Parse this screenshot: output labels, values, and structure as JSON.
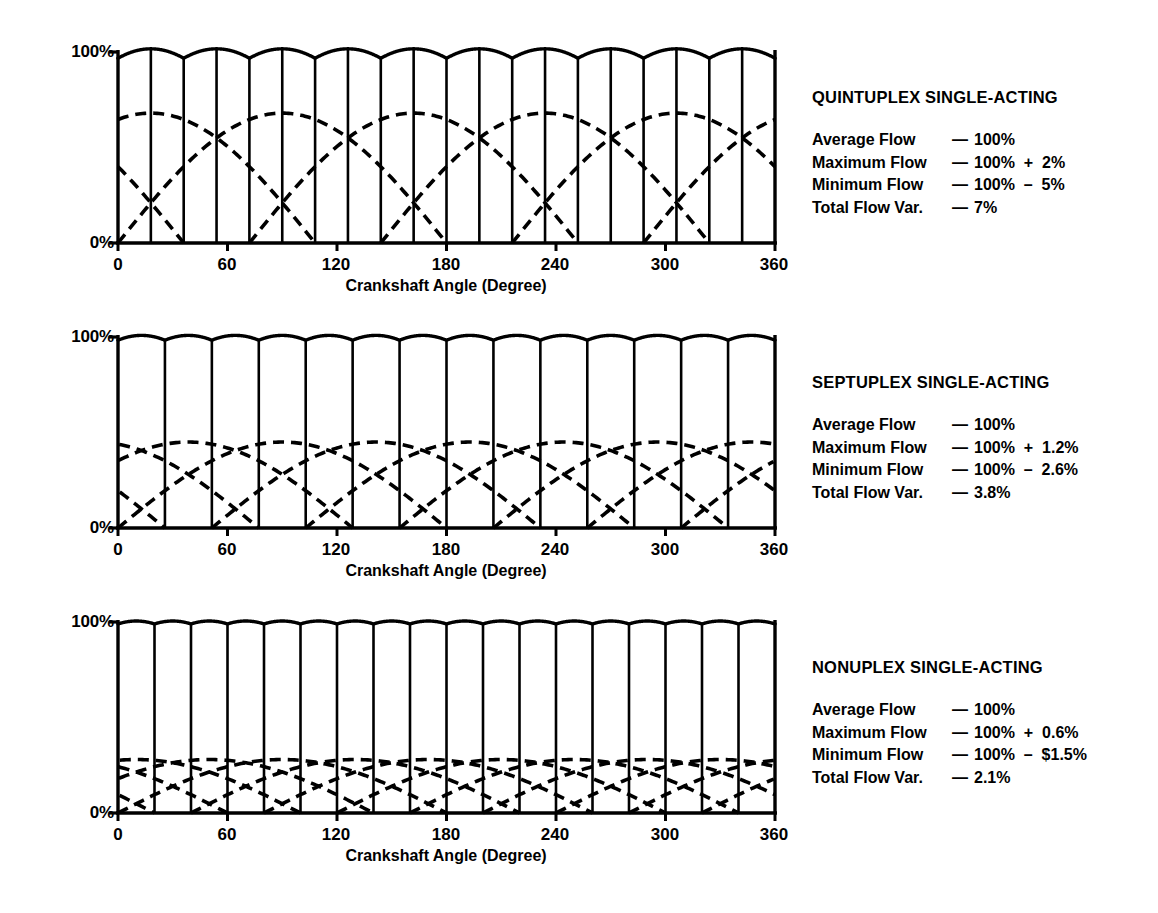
{
  "axis": {
    "y_top_label": "100%",
    "y_bottom_label": "0%",
    "x_title": "Crankshaft Angle (Degree)",
    "x_ticks": [
      "0",
      "60",
      "120",
      "180",
      "240",
      "300",
      "360"
    ]
  },
  "legend_labels": {
    "average": "Average Flow",
    "maximum": "Maximum Flow",
    "minimum": "Minimum Flow",
    "total": "Total Flow Var.",
    "dash": "—"
  },
  "panels": [
    {
      "title": "QUINTUPLEX SINGLE-ACTING",
      "average_flow": "100%",
      "maximum_flow": "100%  +  2%",
      "minimum_flow": "100%  –  5%",
      "total_flow_var": "7%"
    },
    {
      "title": "SEPTUPLEX SINGLE-ACTING",
      "average_flow": "100%",
      "maximum_flow": "100%  +  1.2%",
      "minimum_flow": "100%  –  2.6%",
      "total_flow_var": "3.8%"
    },
    {
      "title": "NONUPLEX SINGLE-ACTING",
      "average_flow": "100%",
      "maximum_flow": "100%  +  0.6%",
      "minimum_flow": "100%  –  $1.5%",
      "total_flow_var": "2.1%"
    }
  ],
  "chart_data": [
    {
      "type": "line",
      "title": "QUINTUPLEX SINGLE-ACTING",
      "xlabel": "Crankshaft Angle (Degree)",
      "ylabel": "",
      "xlim": [
        0,
        360
      ],
      "ylim": [
        0,
        108
      ],
      "xticks": [
        0,
        60,
        120,
        180,
        240,
        300,
        360
      ],
      "yticks": [
        0,
        100
      ],
      "ytick_labels": [
        "0%",
        "100%"
      ],
      "grid": false,
      "plungers": 5,
      "pulses_per_rev": 10,
      "divisions": 20,
      "plunger_peak_pct": 68,
      "combined_mean_pct": 100,
      "combined_max_pct": 102,
      "combined_min_pct": 95,
      "total_variation_pct": 7,
      "series": [
        {
          "name": "individual plunger flow",
          "style": "dashed",
          "shape": "half-sine",
          "count": 5,
          "phase_step_deg": 72,
          "amplitude_pct": 68
        },
        {
          "name": "combined flow",
          "style": "solid",
          "shape": "scalloped",
          "ripple_peaks": 10,
          "mean_pct": 100
        }
      ]
    },
    {
      "type": "line",
      "title": "SEPTUPLEX SINGLE-ACTING",
      "xlabel": "Crankshaft Angle (Degree)",
      "ylabel": "",
      "xlim": [
        0,
        360
      ],
      "ylim": [
        0,
        108
      ],
      "xticks": [
        0,
        60,
        120,
        180,
        240,
        300,
        360
      ],
      "yticks": [
        0,
        100
      ],
      "ytick_labels": [
        "0%",
        "100%"
      ],
      "grid": false,
      "plungers": 7,
      "pulses_per_rev": 14,
      "divisions": 14,
      "plunger_peak_pct": 45,
      "combined_mean_pct": 100,
      "combined_max_pct": 101.2,
      "combined_min_pct": 97.4,
      "total_variation_pct": 3.8,
      "series": [
        {
          "name": "individual plunger flow",
          "style": "dashed",
          "shape": "half-sine",
          "count": 7,
          "phase_step_deg": 51.43,
          "amplitude_pct": 45
        },
        {
          "name": "combined flow",
          "style": "solid",
          "shape": "scalloped",
          "ripple_peaks": 14,
          "mean_pct": 100
        }
      ]
    },
    {
      "type": "line",
      "title": "NONUPLEX SINGLE-ACTING",
      "xlabel": "Crankshaft Angle (Degree)",
      "ylabel": "",
      "xlim": [
        0,
        360
      ],
      "ylim": [
        0,
        108
      ],
      "xticks": [
        0,
        60,
        120,
        180,
        240,
        300,
        360
      ],
      "yticks": [
        0,
        100
      ],
      "ytick_labels": [
        "0%",
        "100%"
      ],
      "grid": false,
      "plungers": 9,
      "pulses_per_rev": 18,
      "divisions": 18,
      "plunger_peak_pct": 28,
      "combined_mean_pct": 100,
      "combined_max_pct": 100.6,
      "combined_min_pct": 98.5,
      "total_variation_pct": 2.1,
      "series": [
        {
          "name": "individual plunger flow",
          "style": "dashed",
          "shape": "half-sine",
          "count": 9,
          "phase_step_deg": 40,
          "amplitude_pct": 28
        },
        {
          "name": "combined flow",
          "style": "solid",
          "shape": "scalloped",
          "ripple_peaks": 18,
          "mean_pct": 100
        }
      ]
    }
  ]
}
